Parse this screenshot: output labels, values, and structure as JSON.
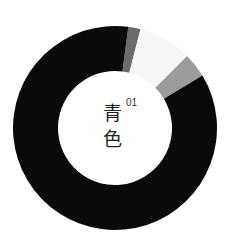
{
  "chart_data": {
    "type": "pie",
    "subtype": "donut",
    "title": "",
    "center_label": {
      "index": "01",
      "text_line1": "青",
      "text_line2": "色"
    },
    "geometry": {
      "cx": 115,
      "cy": 128,
      "outer_radius": 102,
      "inner_radius": 57,
      "start_angle_deg": 0,
      "direction": "clockwise"
    },
    "segments": [
      {
        "name": "dark-gray",
        "start_deg": 7.5,
        "end_deg": 14.5,
        "color": "#6b6b6b"
      },
      {
        "name": "near-white",
        "start_deg": 14.5,
        "end_deg": 45,
        "color": "#f7f7f7"
      },
      {
        "name": "light-gray",
        "start_deg": 45,
        "end_deg": 59,
        "color": "#9c9c9c"
      },
      {
        "name": "black",
        "start_deg": 59,
        "end_deg": 367.5,
        "color": "#0a0a0a"
      }
    ],
    "values_percent": [
      1.9,
      8.5,
      3.9,
      85.7
    ],
    "legend": []
  }
}
